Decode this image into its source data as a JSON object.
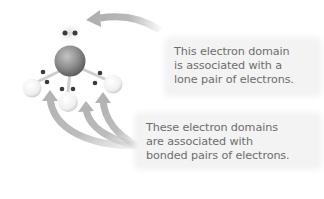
{
  "figure": {
    "colors": {
      "arrow": "#b9b9b9",
      "central_atom": "#8a8a8a",
      "outer_atom": "#f2f2f2",
      "electron_dot": "#3a3a3a",
      "callout_bg": "#f3f3f3",
      "callout_text": "#6d6d6d"
    },
    "molecule": {
      "central_atom": "central-atom",
      "outer_atoms": 3,
      "lone_pairs": 1,
      "bonded_pairs": 3
    },
    "callouts": {
      "lone_pair": {
        "lines": [
          "This electron domain",
          "is associated with a",
          "lone pair of electrons."
        ]
      },
      "bonded_pairs": {
        "lines": [
          "These electron domains",
          "are associated with",
          "bonded pairs of electrons."
        ]
      }
    }
  }
}
